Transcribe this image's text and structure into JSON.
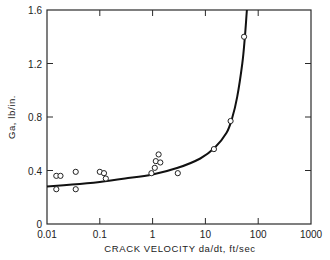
{
  "chart_data": {
    "type": "scatter",
    "title": "",
    "xlabel": "CRACK VELOCITY da/dt, ft/sec",
    "ylabel": "Ga, lb/in.",
    "xscale": "log",
    "xlim": [
      0.01,
      1000
    ],
    "ylim": [
      0,
      1.6
    ],
    "x_ticks": [
      "0.01",
      "0.1",
      "1",
      "10",
      "100",
      "1000"
    ],
    "y_ticks": [
      "0",
      "0.4",
      "0.8",
      "1.2",
      "1.6"
    ],
    "grid": false,
    "legend": null,
    "series": [
      {
        "name": "measured",
        "marker": "open-circle",
        "points": [
          {
            "x": 0.015,
            "y": 0.36
          },
          {
            "x": 0.018,
            "y": 0.36
          },
          {
            "x": 0.015,
            "y": 0.26
          },
          {
            "x": 0.035,
            "y": 0.39
          },
          {
            "x": 0.035,
            "y": 0.26
          },
          {
            "x": 0.1,
            "y": 0.39
          },
          {
            "x": 0.12,
            "y": 0.38
          },
          {
            "x": 0.13,
            "y": 0.34
          },
          {
            "x": 0.95,
            "y": 0.38
          },
          {
            "x": 1.1,
            "y": 0.42
          },
          {
            "x": 1.15,
            "y": 0.47
          },
          {
            "x": 1.4,
            "y": 0.46
          },
          {
            "x": 1.3,
            "y": 0.52
          },
          {
            "x": 3.0,
            "y": 0.38
          },
          {
            "x": 14.5,
            "y": 0.56
          },
          {
            "x": 30,
            "y": 0.77
          },
          {
            "x": 54,
            "y": 1.4
          }
        ]
      },
      {
        "name": "fit curve",
        "type": "line",
        "points": [
          {
            "x": 0.01,
            "y": 0.28
          },
          {
            "x": 0.03,
            "y": 0.295
          },
          {
            "x": 0.1,
            "y": 0.315
          },
          {
            "x": 0.3,
            "y": 0.34
          },
          {
            "x": 1,
            "y": 0.37
          },
          {
            "x": 3,
            "y": 0.42
          },
          {
            "x": 8,
            "y": 0.49
          },
          {
            "x": 15,
            "y": 0.57
          },
          {
            "x": 25,
            "y": 0.68
          },
          {
            "x": 32,
            "y": 0.79
          },
          {
            "x": 40,
            "y": 0.95
          },
          {
            "x": 50,
            "y": 1.2
          },
          {
            "x": 56,
            "y": 1.4
          },
          {
            "x": 61,
            "y": 1.6
          }
        ]
      }
    ]
  }
}
